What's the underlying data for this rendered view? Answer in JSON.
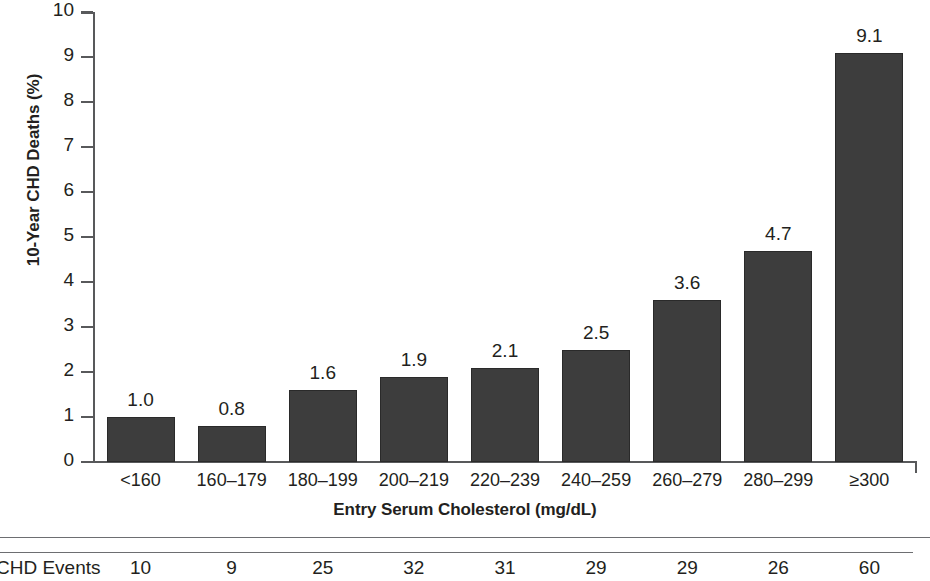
{
  "chart_data": {
    "type": "bar",
    "title": "",
    "xlabel": "Entry Serum Cholesterol (mg/dL)",
    "ylabel": "10-Year CHD Deaths (%)",
    "ylim": [
      0,
      10
    ],
    "yticks": [
      "10",
      "9",
      "8",
      "7",
      "6",
      "5",
      "4",
      "3",
      "2",
      "1",
      "0"
    ],
    "grid": false,
    "legend": "none",
    "bar_color": "#3d3d3d",
    "categories": [
      "<160",
      "160–179",
      "180–199",
      "200–219",
      "220–239",
      "240–259",
      "260–279",
      "280–299",
      "≥300"
    ],
    "values": [
      1.0,
      0.8,
      1.6,
      1.9,
      2.1,
      2.5,
      3.6,
      4.7,
      9.1
    ],
    "value_labels": [
      "1.0",
      "0.8",
      "1.6",
      "1.9",
      "2.1",
      "2.5",
      "3.6",
      "4.7",
      "9.1"
    ]
  },
  "table": {
    "row_label": "CHD Events",
    "values": [
      "10",
      "9",
      "25",
      "32",
      "31",
      "29",
      "29",
      "26",
      "60"
    ]
  }
}
